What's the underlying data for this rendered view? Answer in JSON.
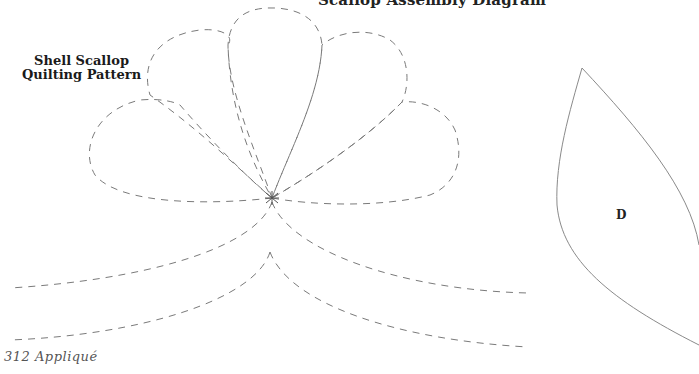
{
  "header": {
    "title": "Scallop Assembly Diagram"
  },
  "pattern": {
    "title_line1": "Shell Scallop",
    "title_line2": "Quilting Pattern",
    "line_style": "dashed",
    "line_color": "#777777"
  },
  "template_piece": {
    "label": "D",
    "outline_color": "#888888"
  },
  "footer": {
    "page_label": "312 Appliqué"
  }
}
